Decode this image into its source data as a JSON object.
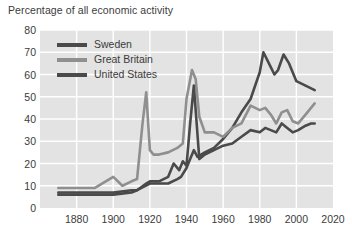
{
  "chart_data": {
    "type": "line",
    "title": "Percentage of all economic activity",
    "xlabel": "",
    "ylabel": "",
    "xlim": [
      1860,
      2020
    ],
    "ylim": [
      0,
      80
    ],
    "xticks": [
      1880,
      1900,
      1920,
      1940,
      1960,
      1980,
      2000,
      2020
    ],
    "yticks": [
      0,
      10,
      20,
      30,
      40,
      50,
      60,
      70,
      80
    ],
    "grid": true,
    "legend_position": "top-left",
    "plot_background": "#e3e3e3",
    "gridline_color": "#ffffff",
    "text_color": "#3b3b3b",
    "series": [
      {
        "name": "Sweden",
        "color": "#4a4a4a",
        "x": [
          1870,
          1880,
          1890,
          1900,
          1910,
          1913,
          1920,
          1925,
          1930,
          1935,
          1937,
          1940,
          1942,
          1944,
          1946,
          1950,
          1955,
          1960,
          1965,
          1970,
          1975,
          1980,
          1982,
          1985,
          1988,
          1990,
          1993,
          1996,
          2000,
          2005,
          2010
        ],
        "values": [
          6,
          6,
          6,
          6,
          7,
          8,
          11,
          11,
          11,
          13,
          14,
          18,
          22,
          26,
          23,
          25,
          27,
          31,
          36,
          43,
          49,
          61,
          70,
          65,
          60,
          62,
          69,
          65,
          57,
          55,
          53
        ]
      },
      {
        "name": "Great Britain",
        "color": "#8f8f8f",
        "x": [
          1870,
          1880,
          1890,
          1900,
          1905,
          1910,
          1913,
          1916,
          1918,
          1920,
          1922,
          1925,
          1930,
          1935,
          1938,
          1940,
          1943,
          1945,
          1947,
          1950,
          1955,
          1960,
          1965,
          1970,
          1975,
          1980,
          1983,
          1986,
          1989,
          1992,
          1995,
          1998,
          2001,
          2005,
          2010
        ],
        "values": [
          9,
          9,
          9,
          14,
          10,
          12,
          13,
          38,
          52,
          26,
          24,
          24,
          25,
          27,
          29,
          49,
          62,
          58,
          41,
          34,
          34,
          32,
          36,
          38,
          46,
          44,
          45,
          42,
          38,
          43,
          44,
          39,
          38,
          42,
          47
        ]
      },
      {
        "name": "United States",
        "color": "#4a4a4a",
        "x": [
          1870,
          1880,
          1890,
          1900,
          1910,
          1913,
          1918,
          1920,
          1925,
          1930,
          1933,
          1936,
          1938,
          1940,
          1942,
          1944,
          1945,
          1947,
          1950,
          1955,
          1960,
          1965,
          1970,
          1975,
          1980,
          1983,
          1986,
          1989,
          1992,
          1995,
          1998,
          2001,
          2005,
          2008,
          2010
        ],
        "values": [
          7,
          7,
          7,
          7,
          8,
          8,
          11,
          12,
          12,
          14,
          20,
          17,
          21,
          19,
          38,
          55,
          44,
          22,
          24,
          26,
          28,
          29,
          32,
          35,
          34,
          36,
          35,
          34,
          38,
          36,
          34,
          35,
          37,
          38,
          38
        ]
      }
    ]
  },
  "legend": [
    {
      "label": "Sweden",
      "color": "#4a4a4a"
    },
    {
      "label": "Great Britain",
      "color": "#8f8f8f"
    },
    {
      "label": "United States",
      "color": "#4a4a4a"
    }
  ]
}
